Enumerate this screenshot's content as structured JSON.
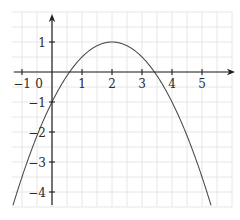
{
  "figure": {
    "background": "#ffffff",
    "grid_color": "#e6e6e6",
    "axis_color": "#1f1f1f",
    "curve_color": "#4f4f4f",
    "label_color": "#2a2a2a"
  },
  "chart_data": {
    "type": "line",
    "title": "",
    "function": "y = 1 - (x - 2)^2 / 2",
    "polynomial_coefficients": {
      "x2": -0.5,
      "x1": 2,
      "x0": -1
    },
    "vertex": {
      "x": 2,
      "y": 1
    },
    "x_intercepts": [
      0.586,
      3.414
    ],
    "y_intercept": -1,
    "plot_domain": [
      -1.3,
      5.33
    ],
    "xlim": [
      -1.35,
      6.1
    ],
    "ylim": [
      -4.55,
      1.95
    ],
    "x_ticks": [
      -1,
      1,
      2,
      3,
      4,
      5
    ],
    "x_tick_labels": [
      "−1",
      "1",
      "2",
      "3",
      "4",
      "5"
    ],
    "origin_label": "0",
    "y_ticks": [
      1,
      -1,
      -2,
      -3,
      -4
    ],
    "y_tick_labels": [
      "1",
      "−1",
      "−2",
      "−3",
      "−4"
    ],
    "grid": true,
    "grid_step": 0.5,
    "legend": "none",
    "xlabel": "",
    "ylabel": ""
  }
}
